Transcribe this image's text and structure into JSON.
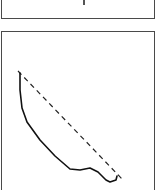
{
  "diagram": {
    "top_panel": {
      "label": ""
    },
    "bottom_panel": {
      "reference_line": {
        "style": "dashed",
        "color": "#222222",
        "from": [
          18,
          71
        ],
        "to": [
          124,
          181
        ]
      },
      "curve": {
        "style": "solid",
        "color": "#111111",
        "points": [
          [
            20,
            73
          ],
          [
            20,
            90
          ],
          [
            22,
            108
          ],
          [
            27,
            122
          ],
          [
            40,
            140
          ],
          [
            55,
            156
          ],
          [
            70,
            169
          ],
          [
            80,
            170
          ],
          [
            90,
            168
          ],
          [
            98,
            172
          ],
          [
            106,
            180
          ],
          [
            110,
            182
          ],
          [
            116,
            180
          ],
          [
            117,
            176
          ]
        ]
      }
    }
  }
}
